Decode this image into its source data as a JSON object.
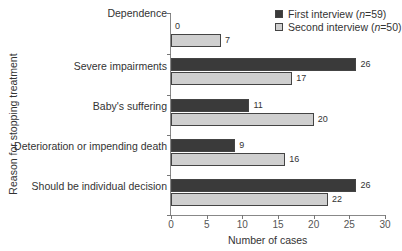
{
  "chart_data": {
    "type": "bar",
    "orientation": "horizontal",
    "title": "",
    "xlabel": "Number of cases",
    "ylabel": "Reason for stopping treatment",
    "xlim": [
      0,
      30
    ],
    "xticks": [
      "0",
      "5",
      "10",
      "15",
      "20",
      "25",
      "30"
    ],
    "categories": [
      "Dependence",
      "Severe impairments",
      "Baby's suffering",
      "Deterioration or impending death",
      "Should be individual decision"
    ],
    "series": [
      {
        "name": "First interview (n=59)",
        "color": "#3a3a3a",
        "values": [
          0,
          26,
          11,
          9,
          26
        ]
      },
      {
        "name": "Second interview (n=50)",
        "color": "#cfcfcf",
        "values": [
          7,
          17,
          20,
          16,
          22
        ]
      }
    ],
    "legend_position": "top-right",
    "grid": false
  },
  "legend": {
    "first_prefix": "First interview (",
    "first_n": "n",
    "first_suffix": "=59)",
    "second_prefix": "Second interview (",
    "second_n": "n",
    "second_suffix": "=50)"
  }
}
